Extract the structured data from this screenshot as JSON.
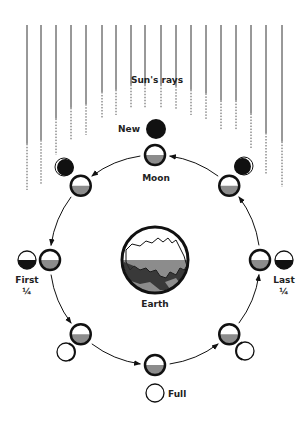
{
  "diagram": {
    "labels": {
      "sun_rays": "Sun's rays",
      "new": "New",
      "moon": "Moon",
      "earth": "Earth",
      "first_line1": "First",
      "first_line2": "¼",
      "last_line1": "Last",
      "last_line2": "¼",
      "full": "Full"
    },
    "phases_in_orbit_order": [
      "New",
      "Waxing Crescent",
      "First Quarter",
      "Waxing Gibbous",
      "Full",
      "Waning Gibbous",
      "Last Quarter",
      "Waning Crescent"
    ],
    "orbit_direction": "counterclockwise",
    "colors": {
      "ink": "#111111",
      "shade": "#8c8c8c",
      "background": "#ffffff"
    }
  }
}
